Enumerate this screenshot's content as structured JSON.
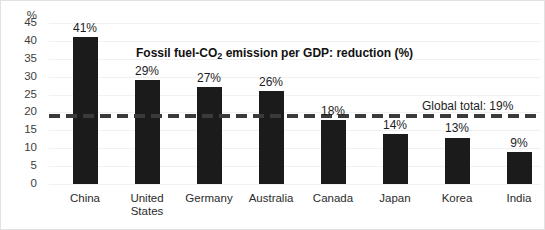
{
  "chart_data": {
    "type": "bar",
    "title": "Fossil fuel-CO2 emission per GDP: reduction  (%)",
    "title_parts": {
      "before": "Fossil fuel-CO",
      "sub": "2",
      "after": " emission per GDP: reduction  (%)"
    },
    "xlabel": "",
    "ylabel": "%",
    "yunit": "%",
    "ylim": [
      0,
      45
    ],
    "ytick_labels": [
      "45",
      "40",
      "35",
      "30",
      "25",
      "20",
      "15",
      "10",
      "5",
      "0"
    ],
    "ytick_values": [
      45,
      40,
      35,
      30,
      25,
      20,
      15,
      10,
      5,
      0
    ],
    "grid": true,
    "legend": "none",
    "categories": [
      "China",
      "United States",
      "Germany",
      "Australia",
      "Canada",
      "Japan",
      "Korea",
      "India"
    ],
    "values": [
      41,
      29,
      27,
      26,
      18,
      14,
      13,
      9
    ],
    "value_labels": [
      "41%",
      "29%",
      "27%",
      "26%",
      "18%",
      "14%",
      "13%",
      "9%"
    ],
    "bar_color": "#1b1b1b",
    "annotations": [
      {
        "name": "global-total",
        "label": "Global total: 19%",
        "value": 19,
        "style": "dashed-horizontal-line",
        "color": "#3a3a3a"
      }
    ],
    "series": [
      {
        "name": "Fossil fuel-CO2 emission per GDP: reduction (%)",
        "values": [
          41,
          29,
          27,
          26,
          18,
          14,
          13,
          9
        ]
      }
    ]
  }
}
